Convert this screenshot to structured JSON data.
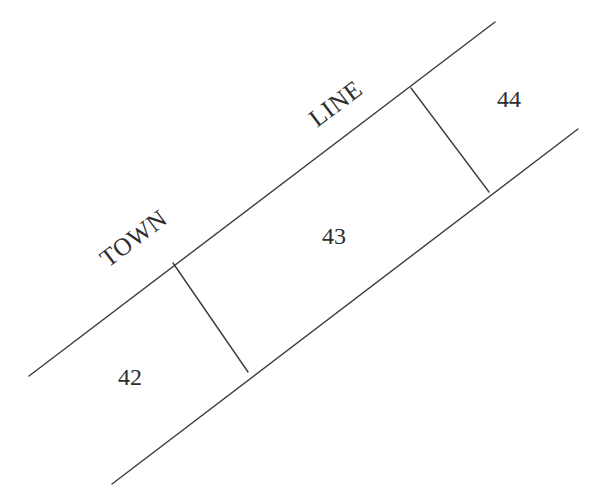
{
  "diagram": {
    "background_color": "#ffffff",
    "line_color": "#3c3c3c",
    "text_color": "#2d2d2d",
    "road_labels": [
      {
        "id": "town",
        "text": "TOWN",
        "x": 108,
        "y": 268,
        "rotation_deg": -37
      },
      {
        "id": "line",
        "text": "LINE",
        "x": 317,
        "y": 128,
        "rotation_deg": -37
      }
    ],
    "parcel_labels": [
      {
        "id": "lot-42",
        "text": "42",
        "x": 118,
        "y": 385
      },
      {
        "id": "lot-43",
        "text": "43",
        "x": 322,
        "y": 244
      },
      {
        "id": "lot-44",
        "text": "44",
        "x": 497,
        "y": 107
      }
    ],
    "boundary_lines": [
      {
        "id": "town-line-upper",
        "x1": 29,
        "y1": 376,
        "x2": 495,
        "y2": 22
      },
      {
        "id": "boundary-lower",
        "x1": 112,
        "y1": 484,
        "x2": 578,
        "y2": 129
      }
    ],
    "divider_lines": [
      {
        "id": "divider-42-43",
        "x1": 173,
        "y1": 263,
        "x2": 248,
        "y2": 372
      },
      {
        "id": "divider-43-44",
        "x1": 411,
        "y1": 88,
        "x2": 489,
        "y2": 192
      }
    ]
  }
}
